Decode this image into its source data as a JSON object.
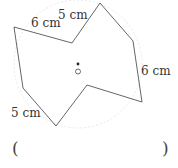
{
  "diagram": {
    "type": "geometry-figure",
    "center_label": "O",
    "vertices": [
      [
        14,
        27
      ],
      [
        72,
        43
      ],
      [
        100,
        3
      ],
      [
        133,
        41
      ],
      [
        142,
        102
      ],
      [
        87,
        85
      ],
      [
        56,
        126
      ],
      [
        23,
        88
      ]
    ],
    "edge_labels": [
      {
        "text": "6 cm",
        "x": 31,
        "y": 17
      },
      {
        "text": "5 cm",
        "x": 58,
        "y": 9
      },
      {
        "text": "6 cm",
        "x": 141,
        "y": 65
      },
      {
        "text": "5 cm",
        "x": 11,
        "y": 107
      }
    ],
    "colors": {
      "stroke": "#555555",
      "arc": "#dddddd",
      "text": "#333333"
    }
  },
  "answer": {
    "open_paren": "(",
    "close_paren": ")"
  }
}
